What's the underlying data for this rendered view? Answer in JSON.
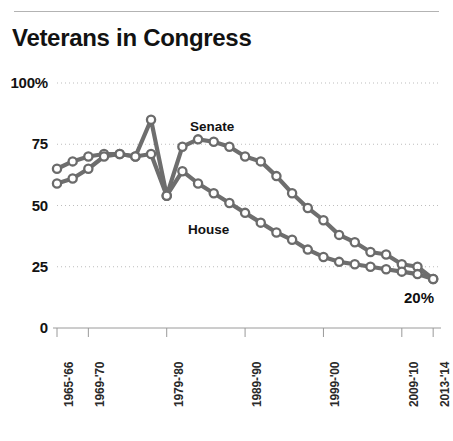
{
  "title": "Veterans in Congress",
  "caption": "",
  "colors": {
    "line": "#6e6e6e",
    "marker_fill": "#ffffff",
    "marker_stroke": "#6b6b6b",
    "grid": "#bdbdbd",
    "axis": "#9a9a9a",
    "text": "#121212"
  },
  "axes": {
    "y_ticks": [
      "100%",
      "75",
      "50",
      "25",
      "0"
    ],
    "y_values": [
      100,
      75,
      50,
      25,
      0
    ],
    "x_ticks": [
      "1965-'66",
      "1969-'70",
      "1979-'80",
      "1989-'90",
      "1999-'00",
      "2009-'10",
      "2013-'14"
    ],
    "x_tick_years": [
      1965,
      1969,
      1979,
      1989,
      1999,
      2009,
      2013
    ]
  },
  "annotations": {
    "senate_label": "Senate",
    "house_label": "House",
    "end_value": "20%"
  },
  "chart_data": {
    "type": "line",
    "title": "Veterans in Congress",
    "xlabel": "",
    "ylabel": "",
    "ylim": [
      0,
      100
    ],
    "xlim": [
      1965,
      2014
    ],
    "grid": true,
    "legend": "inline-labels",
    "x": [
      1965,
      1967,
      1969,
      1971,
      1973,
      1975,
      1977,
      1979,
      1981,
      1983,
      1985,
      1987,
      1989,
      1991,
      1993,
      1995,
      1997,
      1999,
      2001,
      2003,
      2005,
      2007,
      2009,
      2011,
      2013
    ],
    "x_tick_labels": [
      "1965-'66",
      "1967-'68",
      "1969-'70",
      "1971-'72",
      "1973-'74",
      "1975-'76",
      "1977-'78",
      "1979-'80",
      "1981-'82",
      "1983-'84",
      "1985-'86",
      "1987-'88",
      "1989-'90",
      "1991-'92",
      "1993-'94",
      "1995-'96",
      "1997-'98",
      "1999-'00",
      "2001-'02",
      "2003-'04",
      "2005-'06",
      "2007-'08",
      "2009-'10",
      "2011-'12",
      "2013-'14"
    ],
    "series": [
      {
        "name": "Senate",
        "values": [
          65,
          68,
          70,
          71,
          71,
          70,
          85,
          54,
          74,
          77,
          76,
          74,
          70,
          68,
          62,
          55,
          49,
          44,
          38,
          35,
          31,
          30,
          26,
          25,
          20
        ]
      },
      {
        "name": "House",
        "values": [
          59,
          61,
          65,
          70,
          71,
          70,
          71,
          54,
          64,
          59,
          55,
          51,
          47,
          43,
          39,
          36,
          32,
          29,
          27,
          26,
          25,
          24,
          23,
          22,
          20
        ]
      }
    ]
  }
}
